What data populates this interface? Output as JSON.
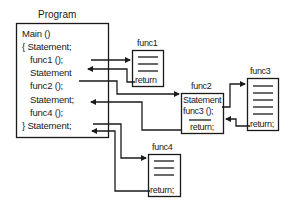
{
  "diagram": {
    "program": {
      "title": "Program",
      "lines": [
        "Main ()",
        "{  Statement;",
        "func1 ();",
        "Statement",
        "func2 ();",
        "Statement;",
        "func4 ();",
        "}  Statement;"
      ]
    },
    "func1": {
      "title": "func1",
      "return": "return"
    },
    "func2": {
      "title": "func2",
      "lines": [
        "Statement",
        "func3 ();"
      ],
      "return": "return;"
    },
    "func3": {
      "title": "func3",
      "return": "return;"
    },
    "func4": {
      "title": "func4",
      "return": "return;"
    },
    "colors": {
      "stroke": "#1a1a1a",
      "background": "#ffffff"
    }
  }
}
